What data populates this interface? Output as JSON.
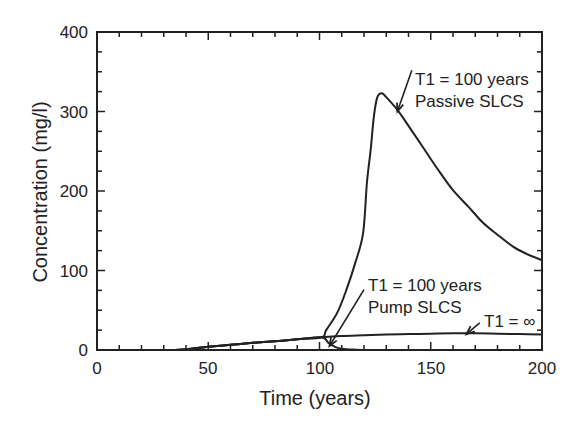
{
  "chart_data": {
    "type": "line",
    "title": "",
    "xlabel": "Time (years)",
    "ylabel": "Concentration (mg/l)",
    "xlim": [
      0,
      200
    ],
    "ylim": [
      0,
      400
    ],
    "xticks": [
      0,
      50,
      100,
      150,
      200
    ],
    "yticks": [
      0,
      100,
      200,
      300,
      400
    ],
    "x_minor_step": 10,
    "y_minor_step": 25,
    "grid": false,
    "legend": null,
    "series": [
      {
        "name": "T1 = 100 years Passive SLCS",
        "points": [
          [
            0,
            0
          ],
          [
            30,
            0
          ],
          [
            40,
            1
          ],
          [
            50,
            4
          ],
          [
            60,
            6.5
          ],
          [
            70,
            9
          ],
          [
            80,
            11
          ],
          [
            90,
            13.5
          ],
          [
            101,
            16
          ],
          [
            103,
            25
          ],
          [
            108,
            47
          ],
          [
            112,
            75
          ],
          [
            116,
            109
          ],
          [
            119.6,
            147
          ],
          [
            121.3,
            210
          ],
          [
            123,
            252
          ],
          [
            124.5,
            295
          ],
          [
            126,
            318
          ],
          [
            128,
            323
          ],
          [
            130,
            318
          ],
          [
            135,
            302
          ],
          [
            140,
            282
          ],
          [
            146.5,
            255
          ],
          [
            153,
            228
          ],
          [
            160,
            201
          ],
          [
            167,
            180
          ],
          [
            173.5,
            160
          ],
          [
            180,
            145
          ],
          [
            187,
            130
          ],
          [
            193,
            121
          ],
          [
            200,
            113
          ]
        ]
      },
      {
        "name": "T1 = 100 years Pump SLCS",
        "points": [
          [
            0,
            0
          ],
          [
            30,
            0
          ],
          [
            40,
            1
          ],
          [
            50,
            4
          ],
          [
            60,
            6.5
          ],
          [
            70,
            9
          ],
          [
            80,
            11
          ],
          [
            90,
            13.5
          ],
          [
            101,
            16
          ],
          [
            104,
            9
          ],
          [
            107,
            4
          ],
          [
            110,
            1.5
          ],
          [
            115,
            0.5
          ],
          [
            130,
            0
          ],
          [
            200,
            0
          ]
        ]
      },
      {
        "name": "T1 = ∞",
        "points": [
          [
            0,
            0
          ],
          [
            30,
            0
          ],
          [
            40,
            1
          ],
          [
            50,
            4
          ],
          [
            60,
            6.5
          ],
          [
            70,
            9
          ],
          [
            80,
            11
          ],
          [
            90,
            13.5
          ],
          [
            101,
            16
          ],
          [
            110,
            17.5
          ],
          [
            120,
            18.5
          ],
          [
            130,
            19.5
          ],
          [
            140,
            20
          ],
          [
            150,
            20.5
          ],
          [
            160,
            21
          ],
          [
            170,
            21
          ],
          [
            180,
            20.5
          ],
          [
            190,
            20
          ],
          [
            200,
            19.5
          ]
        ]
      }
    ],
    "annotations": [
      {
        "lines": [
          "T1 = 100 years",
          "Passive SLCS"
        ],
        "text_xy": [
          143,
          369
        ],
        "arrow_from": [
          141.5,
          352
        ],
        "arrow_to": [
          135,
          300
        ]
      },
      {
        "lines": [
          "T1 = 100 years",
          "Pump SLCS"
        ],
        "text_xy": [
          122.5,
          85
        ],
        "arrow_from": [
          120,
          76
        ],
        "arrow_to": [
          104.5,
          5
        ]
      },
      {
        "lines": [
          "T1 = ∞"
        ],
        "text_xy": [
          173.5,
          37
        ],
        "arrow_from": [
          172,
          34
        ],
        "arrow_to": [
          166,
          20
        ]
      }
    ]
  },
  "labels": {
    "xlabel": "Time (years)",
    "ylabel": "Concentration (mg/l)",
    "xticks": [
      "0",
      "50",
      "100",
      "150",
      "200"
    ],
    "yticks": [
      "0",
      "100",
      "200",
      "300",
      "400"
    ],
    "annot_passive_1": "T1 = 100 years",
    "annot_passive_2": "Passive SLCS",
    "annot_pump_1": "T1 = 100 years",
    "annot_pump_2": "Pump SLCS",
    "annot_inf": "T1 = ∞"
  },
  "style": {
    "line_color": "#222222",
    "axis_color": "#222222",
    "background": "#ffffff"
  }
}
